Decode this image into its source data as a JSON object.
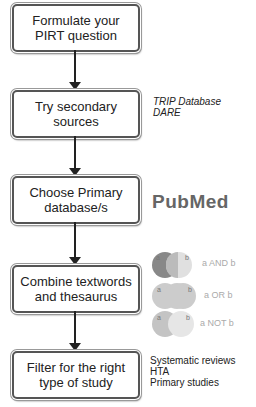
{
  "steps": [
    {
      "label": "Formulate your\nPIRT question"
    },
    {
      "label": "Try secondary\nsources"
    },
    {
      "label": "Choose Primary\ndatabase/s"
    },
    {
      "label": "Combine textwords\nand thesaurus"
    },
    {
      "label": "Filter for the right\ntype of study"
    }
  ],
  "annotations": {
    "secondary": [
      "TRIP Database",
      "DARE"
    ],
    "primary_logo": "PubMed",
    "venn": [
      {
        "a": "a",
        "b": "b",
        "label": "a AND b"
      },
      {
        "a": "a",
        "b": "b",
        "label": "a OR b"
      },
      {
        "a": "a",
        "b": "b",
        "label": "a NOT b"
      }
    ],
    "study_types": [
      "Systematic reviews",
      "HTA",
      "Primary studies"
    ]
  },
  "colors": {
    "box_border": "#555555",
    "arrow": "#222222",
    "logo": "#666666"
  }
}
